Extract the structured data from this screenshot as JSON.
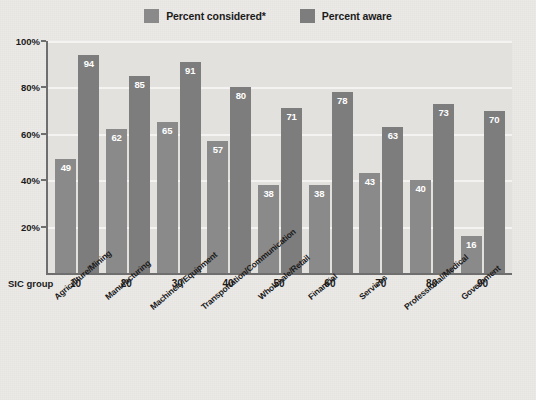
{
  "legend": {
    "items": [
      {
        "label": "Percent considered*",
        "color": "#8a8a8a",
        "name": "percent-considered"
      },
      {
        "label": "Percent aware",
        "color": "#7d7d7d",
        "name": "percent-aware"
      }
    ]
  },
  "axis": {
    "sic_group_label": "SIC group",
    "y_ticks": [
      "100%",
      "80%",
      "60%",
      "40%",
      "20%"
    ],
    "y_tick_values": [
      100,
      80,
      60,
      40,
      20
    ]
  },
  "chart_data": {
    "type": "bar",
    "title": "",
    "xlabel": "SIC group",
    "ylabel": "",
    "ylim": [
      0,
      100
    ],
    "grid": true,
    "legend_position": "top-center",
    "categories": [
      "Agriculture/Mining",
      "Manufacturing",
      "Machinery/Equipment",
      "Transportation/Communication",
      "Wholesale/Retail",
      "Financial",
      "Services",
      "Professional/Medical",
      "Government"
    ],
    "sic_groups": [
      "10",
      "20",
      "30",
      "40",
      "50",
      "60",
      "70",
      "80",
      "90"
    ],
    "series": [
      {
        "name": "Percent considered*",
        "color": "#8a8a8a",
        "values": [
          49,
          62,
          65,
          57,
          38,
          38,
          43,
          40,
          16
        ]
      },
      {
        "name": "Percent aware",
        "color": "#7d7d7d",
        "values": [
          94,
          85,
          91,
          80,
          71,
          78,
          63,
          73,
          70
        ]
      }
    ]
  }
}
